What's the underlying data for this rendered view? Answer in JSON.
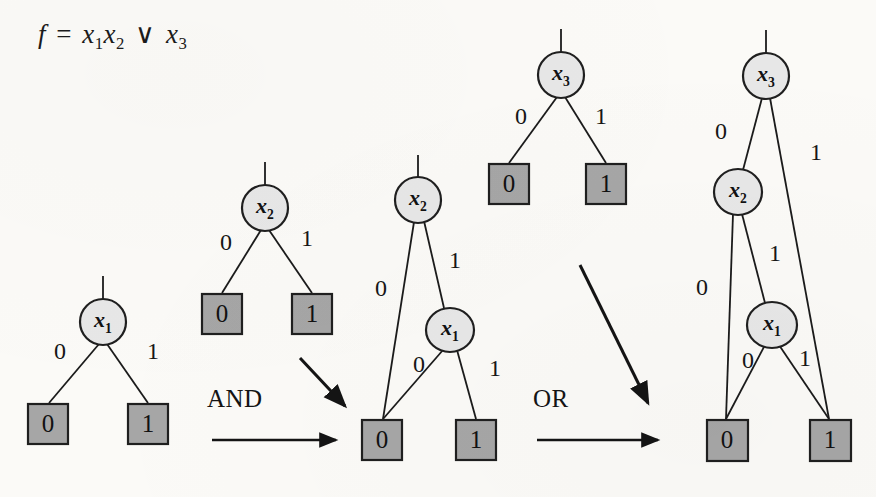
{
  "figure": {
    "background_color": "#fbfaf7",
    "node_fill": "#e7e7e7",
    "node_stroke": "#1f1f1f",
    "terminal_fill": "#a6a6a6",
    "terminal_stroke": "#1f1f1f",
    "edge_color": "#1b1b1b"
  },
  "formula": {
    "lhs": "f",
    "equals": "=",
    "var1": "x",
    "var1_sub": "1",
    "var2": "x",
    "var2_sub": "2",
    "operator": "∨",
    "var3": "x",
    "var3_sub": "3"
  },
  "operations": [
    {
      "label": "AND",
      "x": 246,
      "y": 408
    },
    {
      "label": "OR",
      "x": 568,
      "y": 408
    }
  ],
  "diagrams": [
    {
      "name": "bdd-x1",
      "root": "x1",
      "nodes": [
        {
          "id": "n1",
          "var": "x",
          "sub": "1",
          "cx": 103,
          "cy": 322,
          "rx": 23,
          "ry": 23
        }
      ],
      "terminals": [
        {
          "id": "t0",
          "value": "0",
          "x": 28,
          "y": 404,
          "w": 40,
          "h": 40
        },
        {
          "id": "t1",
          "value": "1",
          "x": 128,
          "y": 404,
          "w": 40,
          "h": 40
        }
      ],
      "edge_labels": [
        {
          "text": "0",
          "x": 60,
          "y": 351
        },
        {
          "text": "1",
          "x": 153,
          "y": 351
        }
      ]
    },
    {
      "name": "bdd-x2",
      "root": "x2",
      "nodes": [
        {
          "id": "n1",
          "var": "x",
          "sub": "2",
          "cx": 265,
          "cy": 208,
          "rx": 23,
          "ry": 23
        }
      ],
      "terminals": [
        {
          "id": "t0",
          "value": "0",
          "x": 202,
          "y": 294,
          "w": 40,
          "h": 40
        },
        {
          "id": "t1",
          "value": "1",
          "x": 292,
          "y": 294,
          "w": 40,
          "h": 40
        }
      ],
      "edge_labels": [
        {
          "text": "0",
          "x": 226,
          "y": 242
        },
        {
          "text": "1",
          "x": 307,
          "y": 238
        }
      ]
    },
    {
      "name": "bdd-and-result",
      "root": "x2",
      "nodes": [
        {
          "id": "n1",
          "var": "x",
          "sub": "2",
          "cx": 418,
          "cy": 200,
          "rx": 23,
          "ry": 23
        },
        {
          "id": "n2",
          "var": "x",
          "sub": "1",
          "cx": 450,
          "cy": 330,
          "rx": 24,
          "ry": 22
        }
      ],
      "terminals": [
        {
          "id": "t0",
          "value": "0",
          "x": 362,
          "y": 420,
          "w": 40,
          "h": 40
        },
        {
          "id": "t1",
          "value": "1",
          "x": 456,
          "y": 420,
          "w": 40,
          "h": 40
        }
      ],
      "edge_labels": [
        {
          "text": "0",
          "x": 381,
          "y": 288
        },
        {
          "text": "1",
          "x": 455,
          "y": 260
        },
        {
          "text": "0",
          "x": 419,
          "y": 364
        },
        {
          "text": "1",
          "x": 495,
          "y": 368
        }
      ]
    },
    {
      "name": "bdd-x3",
      "root": "x3",
      "nodes": [
        {
          "id": "n1",
          "var": "x",
          "sub": "3",
          "cx": 561,
          "cy": 75,
          "rx": 23,
          "ry": 23
        }
      ],
      "terminals": [
        {
          "id": "t0",
          "value": "0",
          "x": 489,
          "y": 164,
          "w": 40,
          "h": 40
        },
        {
          "id": "t1",
          "value": "1",
          "x": 586,
          "y": 164,
          "w": 40,
          "h": 40
        }
      ],
      "edge_labels": [
        {
          "text": "0",
          "x": 521,
          "y": 116
        },
        {
          "text": "1",
          "x": 601,
          "y": 116
        }
      ]
    },
    {
      "name": "bdd-or-result",
      "root": "x3",
      "nodes": [
        {
          "id": "n1",
          "var": "x",
          "sub": "3",
          "cx": 766,
          "cy": 76,
          "rx": 23,
          "ry": 23
        },
        {
          "id": "n2",
          "var": "x",
          "sub": "2",
          "cx": 738,
          "cy": 192,
          "rx": 24,
          "ry": 23
        },
        {
          "id": "n3",
          "var": "x",
          "sub": "1",
          "cx": 772,
          "cy": 325,
          "rx": 25,
          "ry": 23
        }
      ],
      "terminals": [
        {
          "id": "t0",
          "value": "0",
          "x": 707,
          "y": 420,
          "w": 41,
          "h": 41
        },
        {
          "id": "t1",
          "value": "1",
          "x": 810,
          "y": 420,
          "w": 41,
          "h": 41
        }
      ],
      "edge_labels": [
        {
          "text": "0",
          "x": 721,
          "y": 131
        },
        {
          "text": "1",
          "x": 816,
          "y": 152
        },
        {
          "text": "0",
          "x": 702,
          "y": 287
        },
        {
          "text": "1",
          "x": 775,
          "y": 253
        },
        {
          "text": "0",
          "x": 748,
          "y": 360
        },
        {
          "text": "1",
          "x": 805,
          "y": 358
        }
      ]
    }
  ]
}
